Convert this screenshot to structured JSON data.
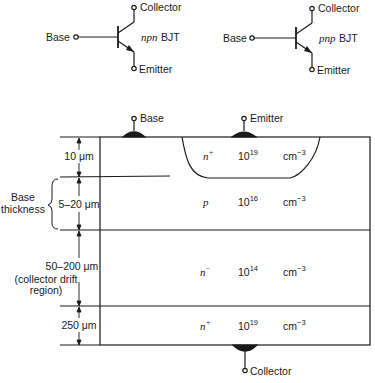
{
  "symbols": {
    "npn": {
      "type_label": "npn",
      "suffix": "BJT",
      "base_label": "Base",
      "collector_label": "Collector",
      "emitter_label": "Emitter"
    },
    "pnp": {
      "type_label": "pnp",
      "suffix": "BJT",
      "base_label": "Base",
      "collector_label": "Collector",
      "emitter_label": "Emitter"
    }
  },
  "cross_section": {
    "contacts": {
      "base": "Base",
      "emitter": "Emitter",
      "collector": "Collector"
    },
    "layers": [
      {
        "name": "emitter",
        "doping_type": "n",
        "doping_sup": "+",
        "conc_base": "10",
        "conc_exp": "19",
        "unit": "cm",
        "unit_exp": "−3",
        "thickness": "10 μm"
      },
      {
        "name": "base",
        "doping_type": "p",
        "doping_sup": "",
        "conc_base": "10",
        "conc_exp": "16",
        "unit": "cm",
        "unit_exp": "−3",
        "thickness": "5–20 μm"
      },
      {
        "name": "collector-drift",
        "doping_type": "n",
        "doping_sup": "−",
        "conc_base": "10",
        "conc_exp": "14",
        "unit": "cm",
        "unit_exp": "−3",
        "thickness": "50–200 μm"
      },
      {
        "name": "collector-substrate",
        "doping_type": "n",
        "doping_sup": "+",
        "conc_base": "10",
        "conc_exp": "19",
        "unit": "cm",
        "unit_exp": "−3",
        "thickness": "250 μm"
      }
    ],
    "annotations": {
      "base_thickness_line1": "Base",
      "base_thickness_line2": "thickness",
      "drift_line1": "(collector drift",
      "drift_line2": "region)"
    }
  }
}
